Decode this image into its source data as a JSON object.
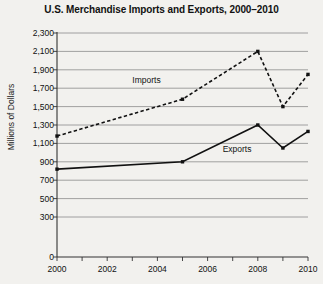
{
  "chart_data": {
    "type": "line",
    "title": "U.S. Merchandise Imports and Exports, 2000–2010",
    "xlabel": "",
    "ylabel": "Millions of Dollars",
    "x": [
      2000,
      2005,
      2008,
      2009,
      2010
    ],
    "xlim": [
      2000,
      2010
    ],
    "ylim": [
      0,
      2300
    ],
    "grid": "horizontal",
    "legend_position": "inline-annotations",
    "ytick_labels": [
      "0",
      "300",
      "500",
      "700",
      "900",
      "1,100",
      "1,300",
      "1,500",
      "1,700",
      "1,900",
      "2,100",
      "2,300"
    ],
    "ytick_values": [
      0,
      300,
      500,
      700,
      900,
      1100,
      1300,
      1500,
      1700,
      1900,
      2100,
      2300
    ],
    "xtick_labels": [
      "2000",
      "2002",
      "2004",
      "2006",
      "2008",
      "2010"
    ],
    "xtick_values": [
      2000,
      2002,
      2004,
      2006,
      2008,
      2010
    ],
    "xminor_values": [
      2001,
      2003,
      2005,
      2007,
      2009
    ],
    "series": [
      {
        "name": "Imports",
        "style": "dashed",
        "color": "#111111",
        "x": [
          2000,
          2005,
          2008,
          2009,
          2010
        ],
        "values": [
          1180,
          1580,
          2100,
          1500,
          1850
        ],
        "label_x": 2003.0,
        "label_y": 1790
      },
      {
        "name": "Exports",
        "style": "solid",
        "color": "#111111",
        "x": [
          2000,
          2005,
          2008,
          2009,
          2010
        ],
        "values": [
          820,
          900,
          1300,
          1050,
          1230
        ],
        "label_x": 2006.6,
        "label_y": 1035
      }
    ]
  }
}
